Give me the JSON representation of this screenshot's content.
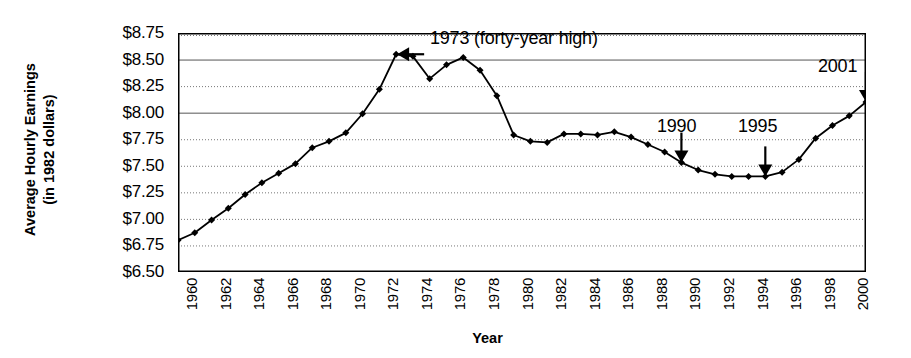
{
  "chart_data": {
    "type": "line",
    "title": "",
    "xlabel": "Year",
    "ylabel_line1": "Average Hourly Earnings",
    "ylabel_line2": "(in 1982 dollars)",
    "ylim": [
      6.5,
      8.75
    ],
    "ytick_labels": [
      "$8.75",
      "$8.50",
      "$8.25",
      "$8.00",
      "$7.75",
      "$7.50",
      "$7.25",
      "$7.00",
      "$6.75",
      "$6.50"
    ],
    "ytick_values": [
      8.75,
      8.5,
      8.25,
      8.0,
      7.75,
      7.5,
      7.25,
      7.0,
      6.75,
      6.5
    ],
    "xlim": [
      1960,
      2001
    ],
    "xtick_labels": [
      "1960",
      "1962",
      "1964",
      "1966",
      "1968",
      "1970",
      "1972",
      "1974",
      "1976",
      "1978",
      "1980",
      "1982",
      "1984",
      "1986",
      "1988",
      "1990",
      "1992",
      "1994",
      "1996",
      "1998",
      "2000"
    ],
    "xtick_values": [
      1960,
      1962,
      1964,
      1966,
      1968,
      1970,
      1972,
      1974,
      1976,
      1978,
      1980,
      1982,
      1984,
      1986,
      1988,
      1990,
      1992,
      1994,
      1996,
      1998,
      2000
    ],
    "grid": true,
    "grid_solid_at": [
      8.5,
      8.0
    ],
    "legend": "none",
    "series": [
      {
        "name": "Average Hourly Earnings (1982 dollars)",
        "color": "#000000",
        "marker": "diamond",
        "x": [
          1960,
          1961,
          1962,
          1963,
          1964,
          1965,
          1966,
          1967,
          1968,
          1969,
          1970,
          1971,
          1972,
          1973,
          1974,
          1975,
          1976,
          1977,
          1978,
          1979,
          1980,
          1981,
          1982,
          1983,
          1984,
          1985,
          1986,
          1987,
          1988,
          1989,
          1990,
          1991,
          1992,
          1993,
          1994,
          1995,
          1996,
          1997,
          1998,
          1999,
          2000,
          2001
        ],
        "y": [
          6.8,
          6.87,
          6.99,
          7.1,
          7.23,
          7.34,
          7.43,
          7.52,
          7.67,
          7.73,
          7.81,
          7.99,
          8.22,
          8.55,
          8.53,
          8.32,
          8.45,
          8.52,
          8.4,
          8.16,
          7.79,
          7.73,
          7.72,
          7.8,
          7.8,
          7.79,
          7.82,
          7.77,
          7.7,
          7.63,
          7.53,
          7.46,
          7.42,
          7.4,
          7.4,
          7.4,
          7.44,
          7.56,
          7.76,
          7.88,
          7.97,
          8.1
        ]
      }
    ],
    "annotations": [
      {
        "label": "1973 (forty-year high)",
        "year": 1973,
        "value": 8.55,
        "arrow": "left"
      },
      {
        "label": "1990",
        "year": 1990,
        "value": 7.53,
        "arrow": "down"
      },
      {
        "label": "1995",
        "year": 1995,
        "value": 7.4,
        "arrow": "down"
      },
      {
        "label": "2001",
        "year": 2001,
        "value": 8.1,
        "arrow": "down"
      }
    ]
  }
}
